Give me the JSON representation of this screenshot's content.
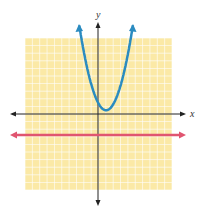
{
  "chart_data": {
    "type": "line",
    "title": "",
    "xlabel": "x",
    "ylabel": "y",
    "xlim": [
      -10,
      10
    ],
    "ylim": [
      -10,
      10
    ],
    "grid": true,
    "grid_step": 1,
    "series": [
      {
        "name": "parabola",
        "color": "#2a8bc0",
        "equation_approx": "y = 0.85(x - 1.1)^2 + 0.5",
        "vertex": [
          1.1,
          0.5
        ],
        "x": [
          -2.6,
          -2,
          -1,
          0,
          1,
          1.1,
          2,
          3,
          4,
          4.8
        ],
        "y": [
          12.1,
          8.7,
          4.3,
          1.5,
          0.5,
          0.5,
          1.2,
          3.6,
          7.6,
          12.1
        ]
      },
      {
        "name": "horizontal line",
        "color": "#e05570",
        "equation_approx": "y = -3",
        "x": [
          -11,
          11
        ],
        "y": [
          -2.8,
          -2.8
        ]
      }
    ]
  },
  "colors": {
    "grid_bg": "#fbe9a6",
    "grid_line": "#ffffff",
    "axis": "#222222",
    "parabola": "#2a8bc0",
    "line": "#e05570"
  },
  "labels": {
    "x": "x",
    "y": "y"
  }
}
